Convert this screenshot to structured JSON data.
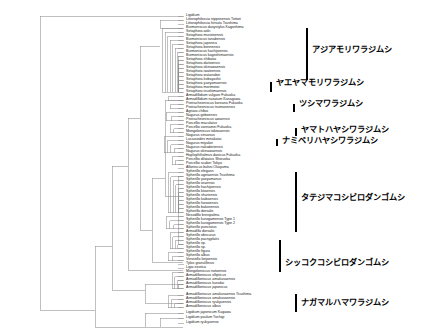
{
  "figure": {
    "type": "phylogenetic-tree",
    "style": "cladogram",
    "line_color": "#8c8c8c",
    "text_color": "#1a1a1a",
    "background": "#ffffff",
    "width": 431,
    "height": 334
  },
  "taxa": [
    {
      "i": 0,
      "label": "Ligidium",
      "y": 16.0,
      "x": 186
    },
    {
      "i": 1,
      "label": "Littorophiloscia nipponensis Tottori",
      "y": 20.0,
      "x": 186
    },
    {
      "i": 2,
      "label": "Littorophiloscia hirsuta Tsushima",
      "y": 24.0,
      "x": 186
    },
    {
      "i": 3,
      "label": "Burmoniscus dasystylus Kagoshima",
      "y": 28.0,
      "x": 186
    },
    {
      "i": 4,
      "label": "Setaphora aoki",
      "y": 32.0,
      "x": 186
    },
    {
      "i": 5,
      "label": "Setaphora murotoensis",
      "y": 36.0,
      "x": 186
    },
    {
      "i": 6,
      "label": "Burmoniscus tanabensis",
      "y": 40.0,
      "x": 186
    },
    {
      "i": 7,
      "label": "Setaphora japonica",
      "y": 44.0,
      "x": 186
    },
    {
      "i": 8,
      "label": "Setaphora bonnensis",
      "y": 48.0,
      "x": 186
    },
    {
      "i": 9,
      "label": "Burmoniscus hachijoensis",
      "y": 52.0,
      "x": 186
    },
    {
      "i": 10,
      "label": "Burmoniscus kagoshimaensis",
      "y": 56.0,
      "x": 186
    },
    {
      "i": 11,
      "label": "Setaphora shibatai",
      "y": 60.0,
      "x": 186
    },
    {
      "i": 12,
      "label": "Setaphora daitoensis",
      "y": 64.0,
      "x": 186
    },
    {
      "i": 13,
      "label": "Setaphora okinawaensis",
      "y": 68.0,
      "x": 186
    },
    {
      "i": 14,
      "label": "Setaphora iwateensis",
      "y": 72.0,
      "x": 186
    },
    {
      "i": 15,
      "label": "Setaphora watanabei",
      "y": 76.0,
      "x": 186
    },
    {
      "i": 16,
      "label": "Setaphora kobayashii",
      "y": 80.0,
      "x": 186
    },
    {
      "i": 17,
      "label": "Setaphora yaeyamaensis",
      "y": 84.0,
      "x": 186
    },
    {
      "i": 18,
      "label": "Setaphora morimotoi",
      "y": 88.0,
      "x": 186
    },
    {
      "i": 19,
      "label": "Setaphora tsushimaensis",
      "y": 92.0,
      "x": 186
    },
    {
      "i": 20,
      "label": "Armadillidium vulgare Fukuoka",
      "y": 96.5,
      "x": 186
    },
    {
      "i": 21,
      "label": "Armadillidium nasatum Kanagawa",
      "y": 100.5,
      "x": 186
    },
    {
      "i": 22,
      "label": "Protracheoniscus koreana Fukuoka",
      "y": 104.5,
      "x": 186
    },
    {
      "i": 23,
      "label": "Protracheoniscus tsumanensis",
      "y": 108.5,
      "x": 186
    },
    {
      "i": 24,
      "label": "Agnara chibai",
      "y": 112.5,
      "x": 186
    },
    {
      "i": 25,
      "label": "Nagurus goboensis",
      "y": 116.5,
      "x": 186
    },
    {
      "i": 26,
      "label": "Protracheoniscus awaensis",
      "y": 120.5,
      "x": 186
    },
    {
      "i": 27,
      "label": "Porcellio maculatus",
      "y": 124.5,
      "x": 186
    },
    {
      "i": 28,
      "label": "Porcellio vannamei Fukuoka",
      "y": 128.5,
      "x": 186
    },
    {
      "i": 29,
      "label": "Mongoloniscus tokiwaensis",
      "y": 132.5,
      "x": 186
    },
    {
      "i": 30,
      "label": "Nagurus sinuosus",
      "y": 136.5,
      "x": 186
    },
    {
      "i": 31,
      "label": "Lucasioides minakatai",
      "y": 140.5,
      "x": 186
    },
    {
      "i": 32,
      "label": "Nagurus miyakei",
      "y": 144.5,
      "x": 186
    },
    {
      "i": 33,
      "label": "Nagurus nakadoriensis",
      "y": 148.5,
      "x": 186
    },
    {
      "i": 34,
      "label": "Nagurus okinawaensis",
      "y": 152.5,
      "x": 186
    },
    {
      "i": 35,
      "label": "Haplophthalmus danicus Fukuoka",
      "y": 156.5,
      "x": 186
    },
    {
      "i": 36,
      "label": "Porcellio dilatatus Shizuoka",
      "y": 160.5,
      "x": 186
    },
    {
      "i": 37,
      "label": "Porcellio scaber Tokyo",
      "y": 164.5,
      "x": 186
    },
    {
      "i": 38,
      "label": "Alloniscus balssi Okayama",
      "y": 168.5,
      "x": 186
    },
    {
      "i": 39,
      "label": "Spherillo elegans",
      "y": 172.5,
      "x": 186
    },
    {
      "i": 40,
      "label": "Spherillo agetaensis Tsushima",
      "y": 176.5,
      "x": 186
    },
    {
      "i": 41,
      "label": "Spherillo yaeyamanus",
      "y": 180.5,
      "x": 186
    },
    {
      "i": 42,
      "label": "Spherillo oraensis",
      "y": 184.5,
      "x": 186
    },
    {
      "i": 43,
      "label": "Spherillo hachijoensis",
      "y": 188.5,
      "x": 186
    },
    {
      "i": 44,
      "label": "Spherillo kitaensis",
      "y": 192.5,
      "x": 186
    },
    {
      "i": 45,
      "label": "Spherillo shuriensis",
      "y": 196.5,
      "x": 186
    },
    {
      "i": 46,
      "label": "Spherillo kaibaensis",
      "y": 200.5,
      "x": 186
    },
    {
      "i": 47,
      "label": "Spherillo hosoiensis",
      "y": 204.5,
      "x": 186
    },
    {
      "i": 48,
      "label": "Spherillo bakonensis",
      "y": 208.5,
      "x": 186
    },
    {
      "i": 49,
      "label": "Spherillo dorsalis",
      "y": 212.5,
      "x": 186
    },
    {
      "i": 50,
      "label": "Nesodillo brevipalma",
      "y": 216.5,
      "x": 186
    },
    {
      "i": 51,
      "label": "Spherillo kurogamensis Type 1",
      "y": 220.5,
      "x": 186
    },
    {
      "i": 52,
      "label": "Spherillo kurogamensis Type 2",
      "y": 224.5,
      "x": 186
    },
    {
      "i": 53,
      "label": "Spherillo punctatus",
      "y": 228.5,
      "x": 186
    },
    {
      "i": 54,
      "label": "Armadillo dorsalis",
      "y": 232.5,
      "x": 186
    },
    {
      "i": 55,
      "label": "Spherillo obscurus",
      "y": 236.5,
      "x": 186
    },
    {
      "i": 56,
      "label": "Spherillo pacnyplatis",
      "y": 240.5,
      "x": 186
    },
    {
      "i": 57,
      "label": "Spherillo sp.",
      "y": 244.5,
      "x": 186
    },
    {
      "i": 58,
      "label": "Spherillo sp.",
      "y": 248.5,
      "x": 186
    },
    {
      "i": 59,
      "label": "Spherillo figura",
      "y": 252.5,
      "x": 186
    },
    {
      "i": 60,
      "label": "Spherillo albus",
      "y": 256.5,
      "x": 186
    },
    {
      "i": 61,
      "label": "Venezillo kinjoensis",
      "y": 260.5,
      "x": 186
    },
    {
      "i": 62,
      "label": "Tylos granuliferus",
      "y": 264.5,
      "x": 186
    },
    {
      "i": 63,
      "label": "Ligia exotica",
      "y": 268.5,
      "x": 186
    },
    {
      "i": 64,
      "label": "Mongoloniscus notoensis",
      "y": 272.5,
      "x": 186
    },
    {
      "i": 65,
      "label": "Armadilloniscus ellipticus",
      "y": 276.5,
      "x": 186
    },
    {
      "i": 66,
      "label": "Armadilloniscus amakusaensis",
      "y": 280.5,
      "x": 186
    },
    {
      "i": 67,
      "label": "Armadilloniscus kurodai",
      "y": 284.5,
      "x": 186
    },
    {
      "i": 68,
      "label": "Armadilloniscus japonicus",
      "y": 288.5,
      "x": 186
    },
    {
      "i": 69,
      "label": "Armadilloniscus amakusaensis Tsushima",
      "y": 295.5,
      "x": 186
    },
    {
      "i": 70,
      "label": "Armadilloniscus amakusaensis",
      "y": 299.5,
      "x": 186
    },
    {
      "i": 71,
      "label": "Armadilloniscus ryukyuensis",
      "y": 303.5,
      "x": 186
    },
    {
      "i": 72,
      "label": "Armadilloniscus albus",
      "y": 307.5,
      "x": 186
    },
    {
      "i": 73,
      "label": "Ligidium japonicum Kagawa",
      "y": 313.0,
      "x": 186
    },
    {
      "i": 74,
      "label": "Ligidium paulum Tochigi",
      "y": 318.0,
      "x": 186
    },
    {
      "i": 75,
      "label": "Ligidium ryukyuense",
      "y": 323.0,
      "x": 186
    }
  ],
  "clades": [
    {
      "id": "asia-moriwarajimushi",
      "label": "アジアモリワラジムシ",
      "bracket_top": 28,
      "bracket_bottom": 80,
      "bracket_x": 306,
      "text_x": 312,
      "text_y": 50
    },
    {
      "id": "yaeyama-moriwarajimushi",
      "label": "ヤエヤマモリワラジムシ",
      "bracket_top": 82,
      "bracket_bottom": 92,
      "bracket_x": 270,
      "text_x": 276,
      "text_y": 83
    },
    {
      "id": "tsushima-warajimushi",
      "label": "ツシマワラジムシ",
      "bracket_top": 104,
      "bracket_bottom": 112,
      "bracket_x": 293,
      "text_x": 299,
      "text_y": 104
    },
    {
      "id": "yamato-hayashiwarajimushi",
      "label": "ヤマトハヤシワラジムシ",
      "bracket_top": 128,
      "bracket_bottom": 136,
      "bracket_x": 295,
      "text_x": 301,
      "text_y": 130
    },
    {
      "id": "namiberi-hayashiwarajimushi",
      "label": "ナミベリハヤシワラジムシ",
      "bracket_top": 139,
      "bracket_bottom": 146,
      "bracket_x": 276,
      "text_x": 282,
      "text_y": 141
    },
    {
      "id": "tatejima-koshibirodangomushi",
      "label": "タテジマコシビロダンゴムシ",
      "bracket_top": 172,
      "bracket_bottom": 232,
      "bracket_x": 295,
      "text_x": 301,
      "text_y": 198
    },
    {
      "id": "shikkoku-koshibirodangomushi",
      "label": "シッコクコシビロダンゴムシ",
      "bracket_top": 240,
      "bracket_bottom": 272,
      "bracket_x": 279,
      "text_x": 285,
      "text_y": 263
    },
    {
      "id": "nagamaru-hamawarajimushi",
      "label": "ナガマルハマワラジムシ",
      "bracket_top": 294,
      "bracket_bottom": 312,
      "bracket_x": 295,
      "text_x": 301,
      "text_y": 303
    }
  ],
  "branches": [
    {
      "d": "M 40 16 L 40 310"
    },
    {
      "d": "M 40 16 L 183 16"
    },
    {
      "d": "M 40 310 L 95 310"
    },
    {
      "d": "M 95 246 L 95 327"
    },
    {
      "d": "M 95 246 L 112 246"
    },
    {
      "d": "M 95 327 L 145 327"
    },
    {
      "d": "M 145 313 L 145 327"
    },
    {
      "d": "M 145 313 L 183 313"
    },
    {
      "d": "M 145 327 L 160 327"
    },
    {
      "d": "M 160 318 L 160 327"
    },
    {
      "d": "M 160 318 L 183 318"
    },
    {
      "d": "M 160 327 L 183 327"
    },
    {
      "d": "M 112 166 L 112 290"
    },
    {
      "d": "M 112 290 L 145 290"
    },
    {
      "d": "M 145 284 L 145 303"
    },
    {
      "d": "M 145 284 L 183 284"
    },
    {
      "d": "M 145 303 L 183 303"
    },
    {
      "d": "M 112 166 L 128 166"
    },
    {
      "d": "M 128 118 L 128 270"
    },
    {
      "d": "M 128 270 L 183 270"
    },
    {
      "d": "M 128 118 L 140 118"
    },
    {
      "d": "M 140 46 L 140 230"
    },
    {
      "d": "M 140 46 L 160 46"
    },
    {
      "d": "M 160 20 L 160 28"
    },
    {
      "d": "M 160 20 L 183 20"
    },
    {
      "d": "M 160 28 L 183 28"
    },
    {
      "d": "M 140 230 L 152 230"
    },
    {
      "d": "M 152 178 L 152 262"
    },
    {
      "d": "M 152 262 L 183 262"
    },
    {
      "d": "M 152 178 L 165 178"
    },
    {
      "d": "M 165 100 L 165 196"
    },
    {
      "d": "M 165 100 L 183 100"
    },
    {
      "d": "M 165 196 L 178 196"
    },
    {
      "d": "M 178 176 L 178 244"
    },
    {
      "d": "M 178 176 L 183 176"
    },
    {
      "d": "M 178 244 L 183 244"
    }
  ]
}
